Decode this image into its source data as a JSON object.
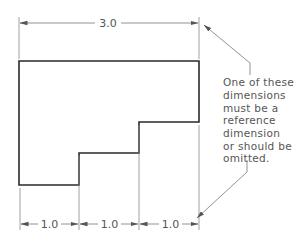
{
  "diagram": {
    "colors": {
      "outline": "#2a2a2a",
      "dimension": "#777777",
      "text": "#555555",
      "background": "#ffffff"
    },
    "overall_dimension": {
      "label": "3.0"
    },
    "bottom_dimensions": [
      {
        "label": "1.0"
      },
      {
        "label": "1.0"
      },
      {
        "label": "1.0"
      }
    ],
    "note": {
      "lines": [
        "One of these",
        "dimensions",
        "must be a",
        "reference",
        "dimension",
        "or should be",
        "omitted."
      ]
    }
  }
}
